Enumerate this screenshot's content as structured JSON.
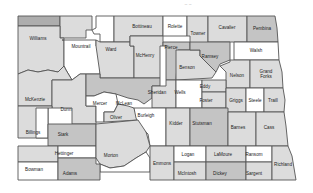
{
  "map": {
    "header_mark": "~ ~",
    "colors": {
      "white": "#ffffff",
      "light": "#dcdcdc",
      "mid": "#c4c4c4",
      "dark": "#adadad"
    },
    "counties": [
      {
        "id": "divide",
        "label": "",
        "shade": "dark",
        "points": "18,16 60,16 60,26 18,26",
        "lx": 0,
        "ly": 0
      },
      {
        "id": "burke",
        "label": "",
        "shade": "light",
        "points": "60,16 92,16 92,30 86,30 86,38 60,38",
        "lx": 0,
        "ly": 0
      },
      {
        "id": "renville",
        "label": "",
        "shade": "white",
        "points": "96,16 114,16 114,42 100,42 100,34 94,34 92,30 96,28",
        "lx": 0,
        "ly": 0
      },
      {
        "id": "bottineau",
        "label": "Bottineau",
        "shade": "light",
        "points": "114,16 163,16 163,36 130,36 130,42 114,42",
        "lx": 142,
        "ly": 27
      },
      {
        "id": "rolette",
        "label": "Rolette",
        "shade": "white",
        "points": "163,16 187,16 187,36 163,36",
        "lx": 175,
        "ly": 27
      },
      {
        "id": "towner",
        "label": "Towner",
        "shade": "light",
        "points": "187,16 208,16 208,50 190,50 190,36 187,36",
        "lx": 198,
        "ly": 34
      },
      {
        "id": "cavalier",
        "label": "Cavalier",
        "shade": "light",
        "points": "208,16 247,16 247,42 208,42",
        "lx": 227,
        "ly": 28
      },
      {
        "id": "pembina",
        "label": "Pembina",
        "shade": "mid",
        "points": "247,16 275,16 277,28 278,42 247,42",
        "lx": 262,
        "ly": 29
      },
      {
        "id": "williams",
        "label": "Williams",
        "shade": "light",
        "points": "18,26 60,26 60,38 64,38 64,66 58,72 48,70 38,72 28,70 18,74",
        "lx": 38,
        "ly": 39
      },
      {
        "id": "mountrail",
        "label": "Mountrail",
        "shade": "white",
        "points": "62,40 96,40 96,46 100,46 100,74 80,74 72,80 66,70 64,66 64,40",
        "lx": 81,
        "ly": 47
      },
      {
        "id": "ward",
        "label": "Ward",
        "shade": "light",
        "points": "96,46 96,40 100,42 114,42 130,42 130,46 134,46 134,78 100,78 100,74",
        "lx": 111,
        "ly": 50
      },
      {
        "id": "mchenry",
        "label": "McHenry",
        "shade": "light",
        "points": "130,36 163,36 163,46 160,46 160,78 134,78 134,46 130,46",
        "lx": 145,
        "ly": 56
      },
      {
        "id": "pierce",
        "label": "Pierce",
        "shade": "mid",
        "points": "163,42 190,42 190,50 178,50 176,80 166,80 166,46 163,46",
        "lx": 171,
        "ly": 48
      },
      {
        "id": "benson",
        "label": "Benson",
        "shade": "light",
        "points": "176,50 200,50 200,56 204,60 210,66 216,72 212,78 176,80",
        "lx": 187,
        "ly": 68
      },
      {
        "id": "ramsey",
        "label": "Ramsey",
        "shade": "mid",
        "points": "190,42 230,42 230,60 220,64 216,72 210,66 204,60 200,56 200,50 190,50",
        "lx": 210,
        "ly": 57
      },
      {
        "id": "walsh",
        "label": "Walsh",
        "shade": "white",
        "points": "234,42 278,42 279,60 234,60",
        "lx": 256,
        "ly": 51
      },
      {
        "id": "nelson",
        "label": "Nelson",
        "shade": "light",
        "points": "230,60 250,60 250,88 226,88 226,72 220,66 230,62",
        "lx": 237,
        "ly": 76
      },
      {
        "id": "grand-forks",
        "label": "Grand\nForks",
        "shade": "light",
        "points": "250,60 279,60 282,72 283,88 250,88",
        "lx": 266,
        "ly": 74
      },
      {
        "id": "mckenzie",
        "label": "McKenzie",
        "shade": "light",
        "points": "18,74 28,70 38,72 48,70 58,72 64,66 66,70 72,80 52,80 52,106 18,106",
        "lx": 35,
        "ly": 100
      },
      {
        "id": "dunn",
        "label": "Dunn",
        "shade": "light",
        "points": "52,80 72,80 80,74 86,74 86,106 96,106 96,124 72,124 72,108 52,108",
        "lx": 66,
        "ly": 110
      },
      {
        "id": "mclean",
        "label": "McLean",
        "shade": "mid",
        "points": "86,74 100,74 100,78 134,78 160,78 160,86 152,86 152,98 144,104 138,100 128,98 116,94 104,92 94,96 86,96",
        "lx": 124,
        "ly": 104
      },
      {
        "id": "mercer",
        "label": "Mercer",
        "shade": "white",
        "points": "86,96 94,96 104,92 116,94 118,104 114,112 104,112 104,122 96,122 96,106 86,106",
        "lx": 100,
        "ly": 104
      },
      {
        "id": "oliver",
        "label": "Oliver",
        "shade": "light",
        "points": "104,112 114,112 118,104 128,106 134,108 138,120 104,122",
        "lx": 116,
        "ly": 118
      },
      {
        "id": "sheridan",
        "label": "Sheridan",
        "shade": "light",
        "points": "152,86 166,86 166,80 176,80 176,108 152,108 152,98",
        "lx": 157,
        "ly": 93
      },
      {
        "id": "wells",
        "label": "Wells",
        "shade": "white",
        "points": "176,80 202,80 202,108 176,108",
        "lx": 180,
        "ly": 93
      },
      {
        "id": "eddy",
        "label": "Eddy",
        "shade": "light",
        "points": "202,80 226,80 226,92 202,92",
        "lx": 205,
        "ly": 87
      },
      {
        "id": "foster",
        "label": "Foster",
        "shade": "light",
        "points": "202,92 226,92 226,108 202,108",
        "lx": 206,
        "ly": 101
      },
      {
        "id": "griggs",
        "label": "Griggs",
        "shade": "light",
        "points": "226,88 246,88 246,112 226,112",
        "lx": 236,
        "ly": 101
      },
      {
        "id": "steele",
        "label": "Steele",
        "shade": "white",
        "points": "246,88 264,88 264,112 246,112",
        "lx": 255,
        "ly": 101
      },
      {
        "id": "traill",
        "label": "Traill",
        "shade": "light",
        "points": "264,88 283,88 285,100 284,112 264,112",
        "lx": 273,
        "ly": 101
      },
      {
        "id": "billings",
        "label": "Billings",
        "shade": "light",
        "points": "18,106 52,106 52,108 48,108 48,138 18,138",
        "lx": 33,
        "ly": 133
      },
      {
        "id": "golden-valley",
        "label": "",
        "shade": "white",
        "points": "36,108 48,108 48,138 36,138",
        "lx": 0,
        "ly": 0
      },
      {
        "id": "stark",
        "label": "Stark",
        "shade": "mid",
        "points": "48,124 96,124 96,146 48,146",
        "lx": 63,
        "ly": 135
      },
      {
        "id": "burleigh",
        "label": "Burleigh",
        "shade": "white",
        "points": "134,108 166,108 166,146 150,146 148,134 140,126 136,118",
        "lx": 146,
        "ly": 116
      },
      {
        "id": "kidder",
        "label": "Kidder",
        "shade": "light",
        "points": "166,108 190,108 190,146 166,146",
        "lx": 176,
        "ly": 124
      },
      {
        "id": "stutsman",
        "label": "Stutsman",
        "shade": "mid",
        "points": "190,108 228,108 228,146 190,146",
        "lx": 202,
        "ly": 124
      },
      {
        "id": "barnes",
        "label": "Barnes",
        "shade": "light",
        "points": "228,112 256,112 256,146 228,146",
        "lx": 238,
        "ly": 128
      },
      {
        "id": "cass",
        "label": "Cass",
        "shade": "light",
        "points": "256,112 284,112 286,126 288,146 256,146",
        "lx": 269,
        "ly": 128
      },
      {
        "id": "slope",
        "label": "",
        "shade": "light",
        "points": "18,146 58,146 58,162 18,162",
        "lx": 0,
        "ly": 0
      },
      {
        "id": "hettinger",
        "label": "Hettinger",
        "shade": "white",
        "points": "58,146 96,146 96,158 58,158",
        "lx": 64,
        "ly": 154
      },
      {
        "id": "morton",
        "label": "Morton",
        "shade": "light",
        "points": "96,124 138,120 146,132 150,146 146,152 136,158 124,166 110,168 100,164 96,158 96,146",
        "lx": 111,
        "ly": 156
      },
      {
        "id": "sioux",
        "label": "",
        "shade": "white",
        "points": "100,164 110,168 124,166 136,158 146,152 150,158 150,172 100,172",
        "lx": 0,
        "ly": 0
      },
      {
        "id": "bowman",
        "label": "Bowman",
        "shade": "white",
        "points": "18,162 58,162 58,180 18,180",
        "lx": 34,
        "ly": 170
      },
      {
        "id": "adams",
        "label": "Adams",
        "shade": "mid",
        "points": "58,158 96,158 96,164 100,164 100,180 58,180",
        "lx": 70,
        "ly": 174
      },
      {
        "id": "emmons",
        "label": "Emmons",
        "shade": "light",
        "points": "150,146 174,146 174,180 150,180",
        "lx": 162,
        "ly": 164
      },
      {
        "id": "logan",
        "label": "Logan",
        "shade": "white",
        "points": "174,146 206,146 206,162 174,162",
        "lx": 188,
        "ly": 155
      },
      {
        "id": "mcintosh",
        "label": "McIntosh",
        "shade": "light",
        "points": "174,162 206,162 206,180 174,180",
        "lx": 187,
        "ly": 174
      },
      {
        "id": "lamoure",
        "label": "LaMoure",
        "shade": "light",
        "points": "206,146 246,146 246,162 206,162",
        "lx": 223,
        "ly": 155
      },
      {
        "id": "dickey",
        "label": "Dickey",
        "shade": "mid",
        "points": "206,162 246,162 246,180 206,180",
        "lx": 220,
        "ly": 174
      },
      {
        "id": "ransom",
        "label": "Ransom",
        "shade": "white",
        "points": "246,146 272,146 272,162 246,162",
        "lx": 254,
        "ly": 155
      },
      {
        "id": "sargent",
        "label": "Sargent",
        "shade": "light",
        "points": "246,162 272,162 272,180 246,180",
        "lx": 254,
        "ly": 174
      },
      {
        "id": "richland",
        "label": "Richland",
        "shade": "light",
        "points": "272,146 288,146 292,156 294,168 296,180 272,180",
        "lx": 283,
        "ly": 165
      }
    ]
  }
}
